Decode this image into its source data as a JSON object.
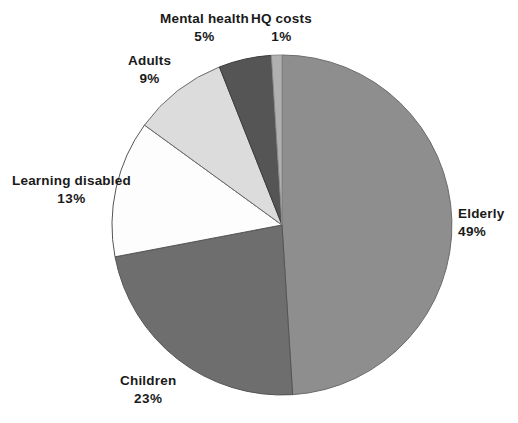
{
  "chart_data": {
    "type": "pie",
    "title": "",
    "subtitle": "",
    "xlabel": "",
    "ylabel": "",
    "legend_position": "none",
    "grid": false,
    "value_unit": "percent",
    "start_angle_deg": 0,
    "direction": "clockwise",
    "categories": [
      "Elderly",
      "Children",
      "Learning disabled",
      "Adults",
      "Mental health",
      "HQ costs"
    ],
    "values": [
      49,
      23,
      13,
      9,
      5,
      1
    ],
    "slices": [
      {
        "name": "Elderly",
        "value": 49,
        "label": "Elderly",
        "value_label": "49%",
        "color": "#8e8e8e",
        "stroke": "#6b6b6b"
      },
      {
        "name": "Children",
        "value": 23,
        "label": "Children",
        "value_label": "23%",
        "color": "#6e6e6e",
        "stroke": "#555555"
      },
      {
        "name": "Learning disabled",
        "value": 13,
        "label": "Learning disabled",
        "value_label": "13%",
        "color": "#fdfdfd",
        "stroke": "#555555"
      },
      {
        "name": "Adults",
        "value": 9,
        "label": "Adults",
        "value_label": "9%",
        "color": "#dcdcdc",
        "stroke": "#6b6b6b"
      },
      {
        "name": "Mental health",
        "value": 5,
        "label": "Mental health",
        "value_label": "5%",
        "color": "#555555",
        "stroke": "#3d3d3d"
      },
      {
        "name": "HQ costs",
        "value": 1,
        "label": "HQ costs",
        "value_label": "1%",
        "color": "#b0b0b0",
        "stroke": "#8a8a8a"
      }
    ]
  },
  "labels": {
    "elderly": {
      "name": "Elderly",
      "value": "49%"
    },
    "children": {
      "name": "Children",
      "value": "23%"
    },
    "learning": {
      "name": "Learning disabled",
      "value": "13%"
    },
    "adults": {
      "name": "Adults",
      "value": "9%"
    },
    "mental": {
      "name": "Mental health",
      "value": "5%"
    },
    "hq": {
      "name": "HQ costs",
      "value": "1%"
    }
  },
  "style": {
    "background": "#ffffff",
    "label_color": "#1a1a1a",
    "center_x": 282,
    "center_y": 225,
    "radius": 170
  }
}
